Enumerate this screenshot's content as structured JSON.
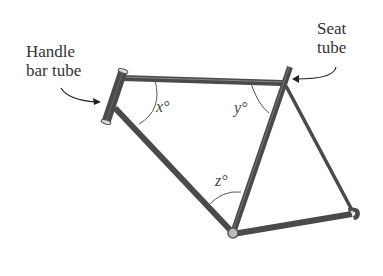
{
  "labels": {
    "handlebar_line1": "Handle",
    "handlebar_line2": "bar tube",
    "seat_line1": "Seat",
    "seat_line2": "tube"
  },
  "angles": {
    "x": "x°",
    "y": "y°",
    "z": "z°"
  },
  "colors": {
    "tube": "#4a4a4a",
    "arc": "#555555",
    "text": "#333333"
  }
}
